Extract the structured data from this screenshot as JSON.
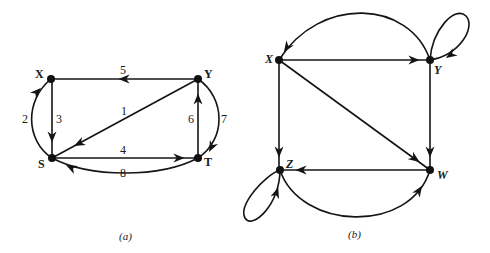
{
  "diagrams": [
    {
      "id": "a",
      "caption": "(a)",
      "type": "directed-multigraph",
      "nodes": [
        {
          "id": "X",
          "label": "X"
        },
        {
          "id": "Y",
          "label": "Y"
        },
        {
          "id": "S",
          "label": "S"
        },
        {
          "id": "T",
          "label": "T"
        }
      ],
      "edges": [
        {
          "label": "1",
          "from": "Y",
          "to": "S"
        },
        {
          "label": "2",
          "from": "S",
          "to": "X"
        },
        {
          "label": "3",
          "from": "X",
          "to": "S"
        },
        {
          "label": "4",
          "from": "S",
          "to": "T"
        },
        {
          "label": "5",
          "from": "Y",
          "to": "X"
        },
        {
          "label": "6",
          "from": "T",
          "to": "Y"
        },
        {
          "label": "7",
          "from": "Y",
          "to": "T"
        },
        {
          "label": "8",
          "from": "T",
          "to": "S"
        }
      ]
    },
    {
      "id": "b",
      "caption": "(b)",
      "type": "directed-graph-with-loops",
      "nodes": [
        {
          "id": "X",
          "label": "X"
        },
        {
          "id": "Y",
          "label": "Y"
        },
        {
          "id": "Z",
          "label": "Z"
        },
        {
          "id": "W",
          "label": "W"
        }
      ],
      "edges": [
        {
          "from": "X",
          "to": "Y"
        },
        {
          "from": "X",
          "to": "Z"
        },
        {
          "from": "X",
          "to": "W"
        },
        {
          "from": "Y",
          "to": "W"
        },
        {
          "from": "W",
          "to": "Z"
        },
        {
          "from": "Y",
          "to": "X",
          "curved": true
        },
        {
          "from": "Z",
          "to": "W",
          "curved": true
        },
        {
          "from": "Y",
          "to": "Y",
          "loop": true
        },
        {
          "from": "Z",
          "to": "Z",
          "loop": true
        }
      ]
    }
  ]
}
